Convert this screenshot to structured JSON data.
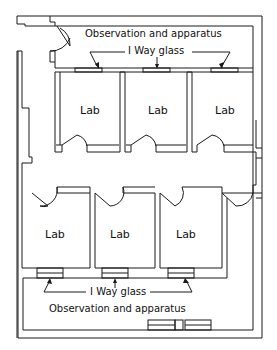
{
  "diagram": {
    "type": "floor-plan",
    "top_area": {
      "label": "Observation and apparatus",
      "glass_label": "I Way glass"
    },
    "bottom_area": {
      "label": "Observation and apparatus",
      "glass_label": "I Way glass"
    },
    "labs": [
      {
        "label": "Lab",
        "row": "top",
        "position": 1
      },
      {
        "label": "Lab",
        "row": "top",
        "position": 2
      },
      {
        "label": "Lab",
        "row": "top",
        "position": 3
      },
      {
        "label": "Lab",
        "row": "bottom",
        "position": 1
      },
      {
        "label": "Lab",
        "row": "bottom",
        "position": 2
      },
      {
        "label": "Lab",
        "row": "bottom",
        "position": 3
      }
    ],
    "colors": {
      "line": "#1a1a1a",
      "background": "#ffffff"
    }
  }
}
